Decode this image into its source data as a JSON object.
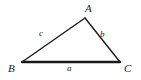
{
  "figure": {
    "type": "triangle-diagram",
    "background_color": "#ffffff",
    "stroke_color": "#1a1a1a"
  },
  "vertices": [
    {
      "id": "A",
      "label": "A",
      "x": 85,
      "y": 18,
      "name": "vertex-a"
    },
    {
      "id": "B",
      "label": "B",
      "x": 22,
      "y": 62,
      "name": "vertex-b"
    },
    {
      "id": "C",
      "label": "C",
      "x": 120,
      "y": 62,
      "name": "vertex-c"
    }
  ],
  "sides": [
    {
      "id": "a",
      "label": "a",
      "from": "B",
      "to": "C",
      "name": "side-a-base"
    },
    {
      "id": "b",
      "label": "b",
      "from": "A",
      "to": "C",
      "name": "side-b-right"
    },
    {
      "id": "c",
      "label": "c",
      "from": "B",
      "to": "A",
      "name": "side-c-left"
    }
  ]
}
